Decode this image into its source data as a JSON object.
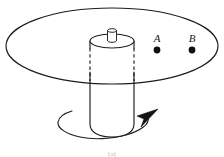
{
  "figure": {
    "caption_mark": "(a)",
    "background_color": "#ffffff",
    "line_color": "#1d1d1d",
    "dot_color": "#111111"
  },
  "disk": {
    "name": "rotating disk",
    "center_x": 112,
    "center_y": 46,
    "radius_x": 106,
    "radius_y": 38
  },
  "cylinder": {
    "name": "central cylinder",
    "center_x": 112,
    "top_y": 41,
    "bottom_y": 136,
    "radius_x": 22,
    "cap_radius_y": 7,
    "hidden_section_end_y": 80
  },
  "knob": {
    "name": "top knob",
    "center_x": 112,
    "top_y": 30,
    "bottom_y": 41,
    "radius_x": 4.5,
    "cap_radius_y": 1.8
  },
  "points": [
    {
      "label": "A",
      "label_x": 157,
      "label_y": 42,
      "dot_x": 157,
      "dot_y": 50,
      "dot_r": 3.4
    },
    {
      "label": "B",
      "label_x": 192,
      "label_y": 42,
      "dot_x": 192,
      "dot_y": 50,
      "dot_r": 3.4
    }
  ],
  "rotation_arrow": {
    "name": "rotation direction arrow",
    "center_x": 110,
    "center_y": 127,
    "radius_x": 53,
    "radius_y": 19,
    "direction": "counterclockwise-viewed-from-above",
    "arrowhead_x": 152,
    "arrowhead_y": 115
  }
}
